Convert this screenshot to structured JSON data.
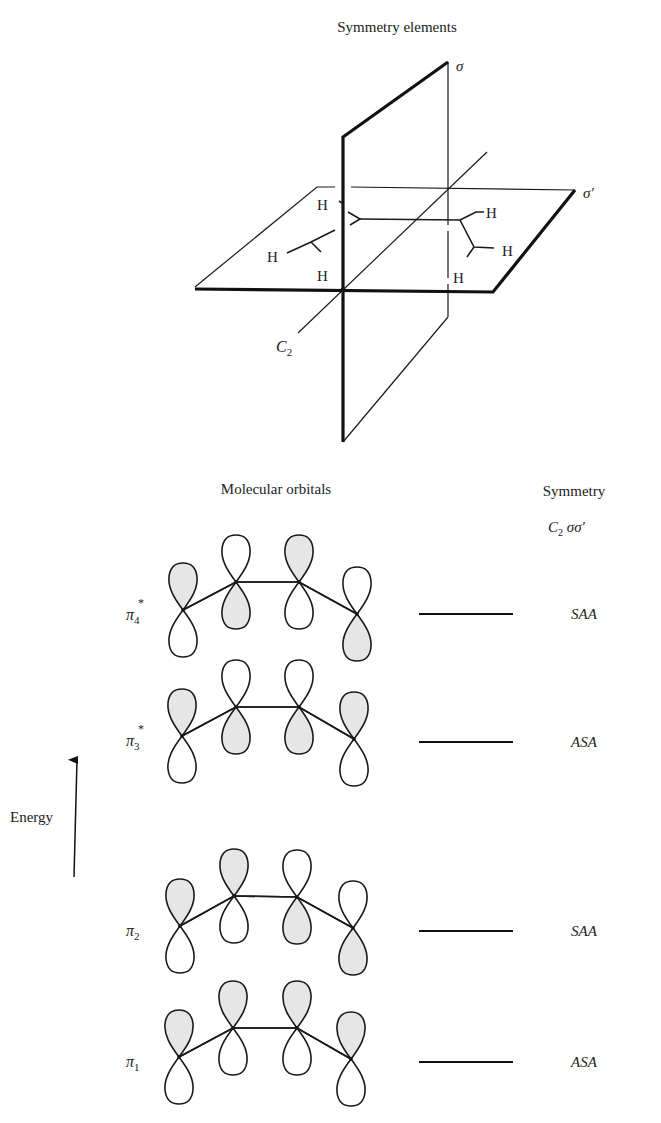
{
  "symmetry_elements": {
    "title": "Symmetry elements",
    "plane_sigma_label": "σ",
    "plane_sigma_prime_label": "σ′",
    "axis_label_main": "C",
    "axis_label_sub": "2",
    "hydrogen_label": "H"
  },
  "orbital_diagram": {
    "title": "Molecular orbitals",
    "symmetry_header": "Symmetry",
    "symmetry_subheader_main": "C",
    "symmetry_subheader_sub": "2",
    "symmetry_subheader_rest": " σσ′",
    "energy_label": "Energy",
    "orbitals": [
      {
        "name": "π4*",
        "label_main": "π",
        "label_sub": "4",
        "label_sup": "*",
        "symmetry": "SAA",
        "atoms": [
          [
            183,
            610
          ],
          [
            236,
            582
          ],
          [
            299,
            582
          ],
          [
            357,
            614
          ]
        ],
        "upper_lobe_shaded": [
          true,
          false,
          true,
          false
        ],
        "level_y": 614
      },
      {
        "name": "π3*",
        "label_main": "π",
        "label_sub": "3",
        "label_sup": "*",
        "symmetry": "ASA",
        "atoms": [
          [
            182,
            736
          ],
          [
            236,
            707
          ],
          [
            299,
            707
          ],
          [
            354,
            739
          ]
        ],
        "upper_lobe_shaded": [
          true,
          false,
          false,
          true
        ],
        "level_y": 742
      },
      {
        "name": "π2",
        "label_main": "π",
        "label_sub": "2",
        "label_sup": "",
        "symmetry": "SAA",
        "atoms": [
          [
            180,
            926
          ],
          [
            234,
            896
          ],
          [
            297,
            897
          ],
          [
            353,
            928
          ]
        ],
        "upper_lobe_shaded": [
          true,
          true,
          false,
          false
        ],
        "level_y": 931
      },
      {
        "name": "π1",
        "label_main": "π",
        "label_sub": "1",
        "label_sup": "",
        "symmetry": "ASA",
        "atoms": [
          [
            179,
            1057
          ],
          [
            233,
            1028
          ],
          [
            297,
            1028
          ],
          [
            351,
            1059
          ]
        ],
        "upper_lobe_shaded": [
          true,
          true,
          true,
          true
        ],
        "level_y": 1062
      }
    ]
  }
}
